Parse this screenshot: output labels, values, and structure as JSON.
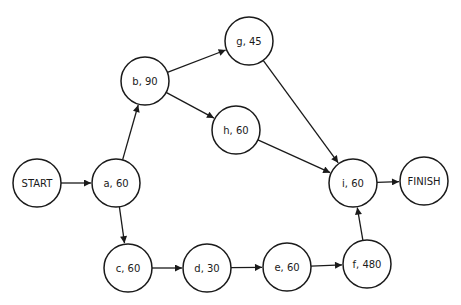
{
  "diagram": {
    "type": "activity-on-node network",
    "colors": {
      "stroke": "#1a1a1a",
      "fill": "#ffffff",
      "text": "#1a1a1a"
    },
    "node_radius": 24,
    "nodes": [
      {
        "id": "start",
        "label": "START",
        "x": 37,
        "y": 183
      },
      {
        "id": "a",
        "label": "a, 60",
        "x": 116,
        "y": 183,
        "activity": "a",
        "duration": 60
      },
      {
        "id": "b",
        "label": "b, 90",
        "x": 145,
        "y": 81,
        "activity": "b",
        "duration": 90
      },
      {
        "id": "g",
        "label": "g, 45",
        "x": 249,
        "y": 41,
        "activity": "g",
        "duration": 45
      },
      {
        "id": "h",
        "label": "h, 60",
        "x": 236,
        "y": 130,
        "activity": "h",
        "duration": 60
      },
      {
        "id": "i",
        "label": "i, 60",
        "x": 353,
        "y": 183,
        "activity": "i",
        "duration": 60
      },
      {
        "id": "finish",
        "label": "FINISH",
        "x": 424,
        "y": 181
      },
      {
        "id": "c",
        "label": "c, 60",
        "x": 128,
        "y": 268,
        "activity": "c",
        "duration": 60
      },
      {
        "id": "d",
        "label": "d, 30",
        "x": 207,
        "y": 268,
        "activity": "d",
        "duration": 30
      },
      {
        "id": "e",
        "label": "e, 60",
        "x": 287,
        "y": 267,
        "activity": "e",
        "duration": 60
      },
      {
        "id": "f",
        "label": "f, 480",
        "x": 367,
        "y": 264,
        "activity": "f",
        "duration": 480
      }
    ],
    "edges": [
      {
        "from": "start",
        "to": "a"
      },
      {
        "from": "a",
        "to": "b"
      },
      {
        "from": "a",
        "to": "c"
      },
      {
        "from": "b",
        "to": "g"
      },
      {
        "from": "b",
        "to": "h"
      },
      {
        "from": "g",
        "to": "i"
      },
      {
        "from": "h",
        "to": "i"
      },
      {
        "from": "c",
        "to": "d"
      },
      {
        "from": "d",
        "to": "e"
      },
      {
        "from": "e",
        "to": "f"
      },
      {
        "from": "f",
        "to": "i"
      },
      {
        "from": "i",
        "to": "finish"
      }
    ]
  }
}
